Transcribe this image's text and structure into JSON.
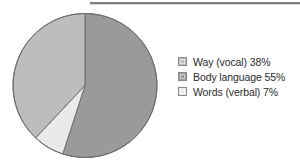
{
  "colors": {
    "page_background": "#ffffff",
    "rule": "#808080",
    "slice_body_language": "#9a9a9a",
    "slice_way_vocal": "#bdbdbd",
    "slice_words_verbal": "#eaeaea",
    "slice_outline": "#6e6e6e",
    "legend_text": "#2b2b2b",
    "legend_swatch_border": "#8a8a8a"
  },
  "divider": {
    "name": "top-horizontal-rule"
  },
  "legend": {
    "position": "right",
    "items": [
      {
        "label": "Way (vocal) 38%",
        "swatch_color": "#bdbdbd",
        "icon": "legend-swatch-icon"
      },
      {
        "label": "Body language 55%",
        "swatch_color": "#9a9a9a",
        "icon": "legend-swatch-icon"
      },
      {
        "label": "Words (verbal) 7%",
        "swatch_color": "#eaeaea",
        "icon": "legend-swatch-icon"
      }
    ]
  },
  "chart_data": {
    "type": "pie",
    "title": "",
    "subtitle": "",
    "xlabel": "",
    "ylabel": "",
    "grid": false,
    "legend_position": "right",
    "start_angle_deg": 0,
    "direction": "clockwise",
    "categories": [
      "Body language",
      "Way (vocal)",
      "Words (verbal)"
    ],
    "values": [
      55,
      38,
      7
    ],
    "unit": "%",
    "slices": [
      {
        "label": "Body language",
        "legend_label": "Body language 55%",
        "value": 55,
        "percent": "55%",
        "color": "#9a9a9a",
        "start_deg": 0,
        "end_deg": 198
      },
      {
        "label": "Way (vocal)",
        "legend_label": "Way (vocal) 38%",
        "value": 38,
        "percent": "38%",
        "color": "#bdbdbd",
        "start_deg": 223.2,
        "end_deg": 360
      },
      {
        "label": "Words (verbal)",
        "legend_label": "Words (verbal) 7%",
        "value": 7,
        "percent": "7%",
        "color": "#eaeaea",
        "start_deg": 198,
        "end_deg": 223.2
      }
    ],
    "total": 100
  },
  "pie_geometry": {
    "center_x": 74,
    "center_y": 73.5,
    "radius": 72
  }
}
